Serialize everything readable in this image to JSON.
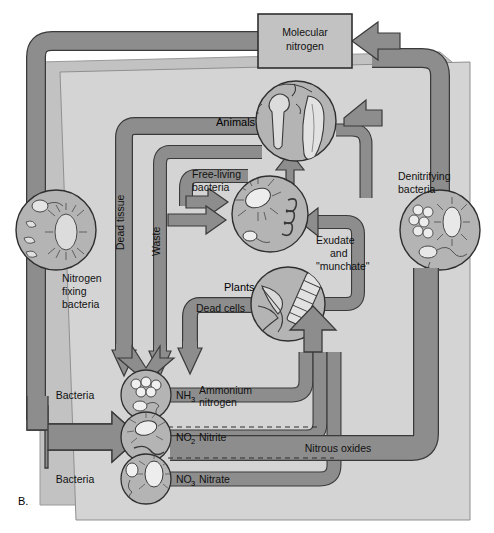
{
  "figure": {
    "panel_label": "B.",
    "colors": {
      "pipe_fill": "#8d8d8d",
      "pipe_stroke": "#3a3a3a",
      "panel_back": "#c9c9c9",
      "panel_front": "#d3d3d3",
      "box_fill": "#c2c2c2",
      "circle_fill": "#b4b4b4",
      "text": "#111111",
      "page": "#ffffff"
    }
  },
  "nodes": {
    "molecular_nitrogen": "Molecular\nnitrogen",
    "molecular_nitrogen_line1": "Molecular",
    "molecular_nitrogen_line2": "nitrogen",
    "animals": "Animals",
    "free_living_line1": "Free-living",
    "free_living_line2": "bacteria",
    "plants": "Plants",
    "nitrogen_fixing_line1": "Nitrogen",
    "nitrogen_fixing_line2": "fixing",
    "nitrogen_fixing_line3": "bacteria",
    "denitrifying_line1": "Denitrifying",
    "denitrifying_line2": "bacteria",
    "bacteria_ammonium": "Bacteria",
    "bacteria_nitrate": "Bacteria"
  },
  "flows": {
    "dead_tissue": "Dead tissue",
    "waste": "Waste",
    "dead_cells": "Dead cells",
    "exudate_line1": "Exudate",
    "exudate_line2": "and",
    "exudate_line3": "\"munchate\"",
    "nitrous_oxides": "Nitrous oxides"
  },
  "compounds": [
    {
      "formula": "NH",
      "sub": "3",
      "name_line1": "Ammonium",
      "name_line2": "nitrogen"
    },
    {
      "formula": "NO",
      "sub": "2",
      "name_line1": "Nitrite",
      "name_line2": ""
    },
    {
      "formula": "NO",
      "sub": "3",
      "name_line1": "Nitrate",
      "name_line2": ""
    }
  ]
}
